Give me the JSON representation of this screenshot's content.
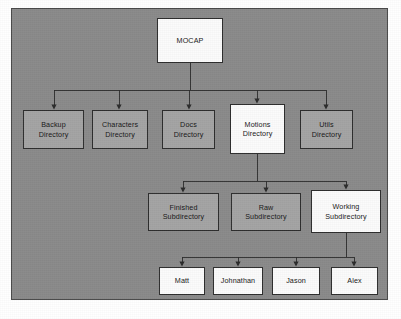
{
  "diagram": {
    "type": "tree-hierarchy",
    "background_color": "#8a8a8a",
    "frame_border_color": "#4a4a4a",
    "node_fill_white": "#fbfbfb",
    "node_fill_gray": "#a4a4a4",
    "node_border_color": "#2e2e2e",
    "connector_color": "#2b2b2b",
    "text_color": "#181818",
    "nodes": [
      {
        "id": "mocap",
        "label_line1": "MOCAP",
        "label_line2": "",
        "fill": "white",
        "level": 0,
        "x": 157,
        "y": 18,
        "w": 66,
        "h": 45
      },
      {
        "id": "backup",
        "label_line1": "Backup",
        "label_line2": "Directory",
        "fill": "gray",
        "level": 1,
        "x": 23,
        "y": 110,
        "w": 61,
        "h": 39
      },
      {
        "id": "characters",
        "label_line1": "Characters",
        "label_line2": "Directory",
        "fill": "gray",
        "level": 1,
        "x": 92,
        "y": 110,
        "w": 56,
        "h": 39
      },
      {
        "id": "docs",
        "label_line1": "Docs",
        "label_line2": "Directory",
        "fill": "gray",
        "level": 1,
        "x": 162,
        "y": 110,
        "w": 53,
        "h": 39
      },
      {
        "id": "motions",
        "label_line1": "Motions",
        "label_line2": "Directory",
        "fill": "white",
        "level": 1,
        "x": 230,
        "y": 104,
        "w": 55,
        "h": 50
      },
      {
        "id": "utils",
        "label_line1": "Utils",
        "label_line2": "Directory",
        "fill": "gray",
        "level": 1,
        "x": 300,
        "y": 110,
        "w": 53,
        "h": 39
      },
      {
        "id": "finished",
        "label_line1": "Finished",
        "label_line2": "Subdirectory",
        "fill": "gray",
        "level": 2,
        "x": 148,
        "y": 193,
        "w": 71,
        "h": 38
      },
      {
        "id": "raw",
        "label_line1": "Raw",
        "label_line2": "Subdirectory",
        "fill": "gray",
        "level": 2,
        "x": 231,
        "y": 193,
        "w": 70,
        "h": 38
      },
      {
        "id": "working",
        "label_line1": "Working",
        "label_line2": "Subdirectory",
        "fill": "white",
        "level": 2,
        "x": 311,
        "y": 190,
        "w": 70,
        "h": 43
      },
      {
        "id": "matt",
        "label_line1": "Matt",
        "label_line2": "",
        "fill": "white",
        "level": 3,
        "x": 159,
        "y": 267,
        "w": 46,
        "h": 28
      },
      {
        "id": "johnathan",
        "label_line1": "Johnathan",
        "label_line2": "",
        "fill": "white",
        "level": 3,
        "x": 213,
        "y": 267,
        "w": 50,
        "h": 28
      },
      {
        "id": "jason",
        "label_line1": "Jason",
        "label_line2": "",
        "fill": "white",
        "level": 3,
        "x": 272,
        "y": 267,
        "w": 48,
        "h": 28
      },
      {
        "id": "alex",
        "label_line1": "Alex",
        "label_line2": "",
        "fill": "white",
        "level": 3,
        "x": 331,
        "y": 267,
        "w": 47,
        "h": 28
      }
    ],
    "edges": [
      {
        "from": "mocap",
        "to": "backup"
      },
      {
        "from": "mocap",
        "to": "characters"
      },
      {
        "from": "mocap",
        "to": "docs"
      },
      {
        "from": "mocap",
        "to": "motions"
      },
      {
        "from": "mocap",
        "to": "utils"
      },
      {
        "from": "motions",
        "to": "finished"
      },
      {
        "from": "motions",
        "to": "raw"
      },
      {
        "from": "motions",
        "to": "working"
      },
      {
        "from": "working",
        "to": "matt"
      },
      {
        "from": "working",
        "to": "johnathan"
      },
      {
        "from": "working",
        "to": "jason"
      },
      {
        "from": "working",
        "to": "alex"
      }
    ]
  }
}
